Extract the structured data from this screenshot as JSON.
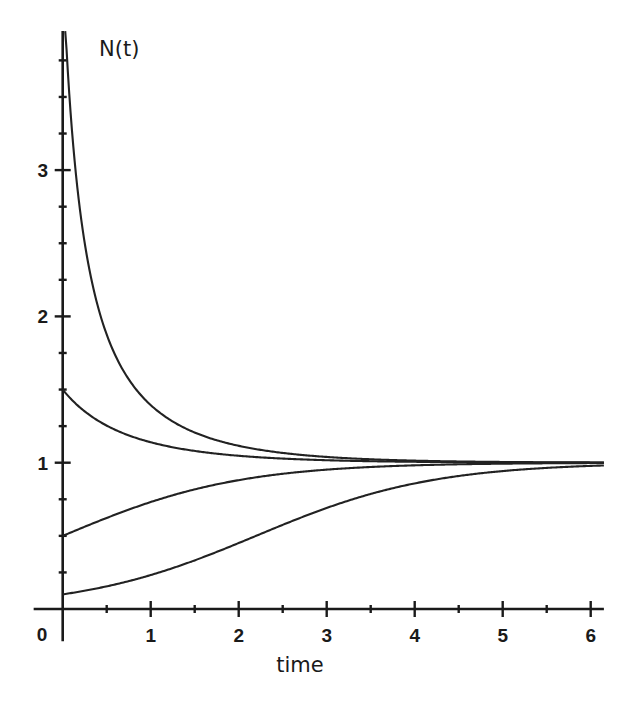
{
  "chart_data": {
    "type": "line",
    "title": "",
    "xlabel": "time",
    "ylabel": "N(t)",
    "xlim": [
      -0.33,
      6.15
    ],
    "ylim": [
      -0.22,
      3.95
    ],
    "grid": false,
    "legend": "none",
    "x_ticks": {
      "major": [
        1,
        2,
        3,
        4,
        5,
        6
      ],
      "minor": [
        0.5,
        1.5,
        2.5,
        3.5,
        4.5,
        5.5
      ],
      "labels": [
        "1",
        "2",
        "3",
        "4",
        "5",
        "6"
      ]
    },
    "origin_label": "0",
    "y_ticks": {
      "major": [
        1,
        2,
        3
      ],
      "minor": [
        0.25,
        0.5,
        0.75,
        1.25,
        1.5,
        1.75,
        2.25,
        2.5,
        2.75,
        3.25,
        3.5,
        3.75
      ],
      "labels": [
        "1",
        "2",
        "3"
      ]
    },
    "model": "logistic N(t) = K / (1 + (K/N0 - 1) e^(-r t))",
    "carrying_capacity": 1,
    "growth_rate": 1,
    "t_range": [
      0,
      6.15
    ],
    "series": [
      {
        "name": "N0 = 4",
        "N0": 4,
        "t": [
          0,
          0.25,
          0.5,
          1,
          1.5,
          2,
          3,
          4,
          5,
          6
        ],
        "values": [
          4.0,
          2.4,
          1.83,
          1.38,
          1.2,
          1.11,
          1.04,
          1.014,
          1.005,
          1.002
        ]
      },
      {
        "name": "N0 = 1.5",
        "N0": 1.5,
        "t": [
          0,
          0.25,
          0.5,
          1,
          1.5,
          2,
          3,
          4,
          5,
          6
        ],
        "values": [
          1.5,
          1.35,
          1.25,
          1.14,
          1.08,
          1.047,
          1.017,
          1.006,
          1.002,
          1.001
        ]
      },
      {
        "name": "N0 = 0.5",
        "N0": 0.5,
        "t": [
          0,
          0.25,
          0.5,
          1,
          1.5,
          2,
          3,
          4,
          5,
          6
        ],
        "values": [
          0.5,
          0.56,
          0.62,
          0.73,
          0.82,
          0.88,
          0.95,
          0.98,
          0.993,
          0.998
        ]
      },
      {
        "name": "N0 = 0.1",
        "N0": 0.1,
        "t": [
          0,
          0.25,
          0.5,
          1,
          1.5,
          2,
          3,
          4,
          5,
          6
        ],
        "values": [
          0.1,
          0.125,
          0.155,
          0.23,
          0.33,
          0.45,
          0.69,
          0.86,
          0.94,
          0.98
        ]
      }
    ]
  }
}
